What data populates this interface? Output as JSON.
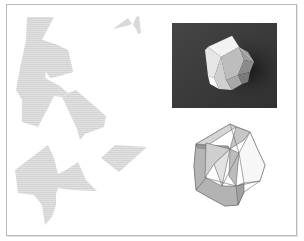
{
  "figure": {
    "colors": {
      "frame_border": "#b9b9b9",
      "net_fill": "#dcdcdc",
      "net_hatch": "#cfcfcf",
      "photo_bg": "#3a3a3a",
      "photo_shadow": "#1e1e1e",
      "wire_stroke": "#6a6a6a"
    },
    "panels": [
      {
        "name": "net-pieces",
        "position": "left"
      },
      {
        "name": "photo-folded-polyhedron",
        "position": "top-right"
      },
      {
        "name": "wireframe-polyhedron",
        "position": "bottom-right"
      }
    ]
  }
}
